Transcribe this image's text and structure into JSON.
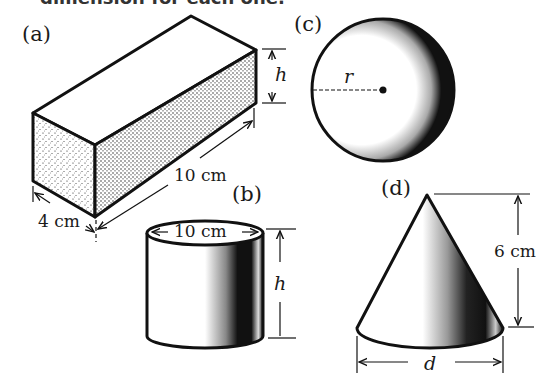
{
  "header": {
    "cutoff_text": "dimension for each one."
  },
  "figures": {
    "a": {
      "label": "(a)",
      "shape": "rectangular-box",
      "height_label": "h",
      "length_label": "10 cm",
      "width_label": "4 cm"
    },
    "b": {
      "label": "(b)",
      "shape": "cylinder",
      "diameter_label": "10 cm",
      "height_label": "h"
    },
    "c": {
      "label": "(c)",
      "shape": "sphere",
      "radius_label": "r"
    },
    "d": {
      "label": "(d)",
      "shape": "cone",
      "height_label": "6 cm",
      "diameter_label": "d"
    }
  },
  "colors": {
    "ink": "#111111",
    "background": "#ffffff"
  }
}
